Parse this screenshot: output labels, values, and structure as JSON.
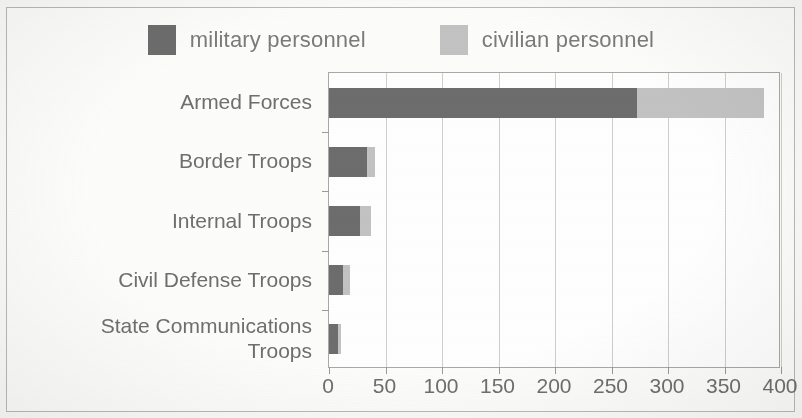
{
  "legend": {
    "entries": [
      {
        "label": "military personnel",
        "color": "#6d6d6d",
        "key": "military"
      },
      {
        "label": "civilian personnel",
        "color": "#c3c3c3",
        "key": "civilian"
      }
    ]
  },
  "axis": {
    "x_ticks": [
      "0",
      "50",
      "100",
      "150",
      "200",
      "250",
      "300",
      "350",
      "400"
    ]
  },
  "chart_data": {
    "type": "bar",
    "orientation": "horizontal",
    "stacked": true,
    "title": "",
    "xlabel": "",
    "ylabel": "",
    "xlim": [
      0,
      400
    ],
    "xticks": [
      0,
      50,
      100,
      150,
      200,
      250,
      300,
      350,
      400
    ],
    "grid": "vertical",
    "legend_position": "top",
    "categories": [
      "Armed Forces",
      "Border Troops",
      "Internal Troops",
      "Civil Defense Troops",
      "State Communications\nTroops"
    ],
    "series": [
      {
        "name": "military personnel",
        "color": "#6d6d6d",
        "values": [
          273,
          34,
          27,
          12,
          8
        ]
      },
      {
        "name": "civilian personnel",
        "color": "#c3c3c3",
        "values": [
          112,
          7,
          10,
          7,
          3
        ]
      }
    ],
    "totals": [
      385,
      41,
      37,
      19,
      11
    ]
  }
}
